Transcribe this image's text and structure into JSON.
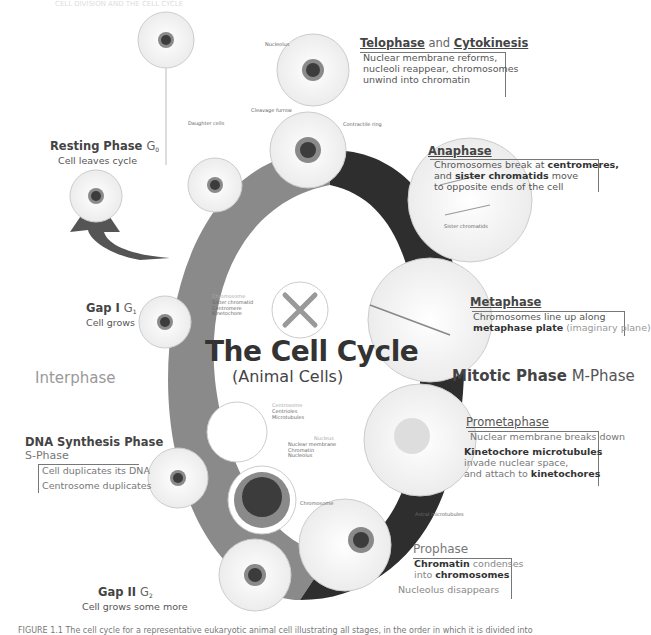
{
  "header": {
    "text": "CELL DIVISION AND THE CELL CYCLE"
  },
  "diagram": {
    "title": "The Cell Cycle",
    "subtitle": "(Animal Cells)",
    "interphase_label": "Interphase",
    "mitotic_label_bold": "Mitotic Phase",
    "mitotic_label_light": "M-Phase",
    "colors": {
      "interphase_arc": "#8a8a8a",
      "mitotic_arc": "#2e2e2e",
      "g0_arrow": "#555555",
      "cell_fill": "#f4f4f4",
      "nucleus_outer": "#9a9a9a",
      "nucleus_inner": "#3c3c3c"
    },
    "phases": {
      "resting": {
        "title": "Resting Phase",
        "sub": "G",
        "subscript": "0",
        "desc": "Cell leaves cycle"
      },
      "gap1": {
        "title": "Gap I",
        "sub": "G",
        "subscript": "1",
        "desc": "Cell grows"
      },
      "dna": {
        "title": "DNA Synthesis Phase",
        "sub": "S-Phase",
        "items": [
          "Cell duplicates its DNA",
          "Centrosome duplicates"
        ]
      },
      "gap2": {
        "title": "Gap II",
        "sub": "G",
        "subscript": "2",
        "desc": "Cell grows some more"
      },
      "prophase": {
        "title": "Prophase",
        "line1_bold": "Chromatin",
        "line1_rest": " condenses",
        "line2_pre": "into ",
        "line2_bold": "chromosomes",
        "extra": "Nucleolus disappears"
      },
      "prometaphase": {
        "title": "Prometaphase",
        "line1": "Nuclear membrane breaks down",
        "line2_bold": "Kinetochore microtubules",
        "line3": "invade nuclear space,",
        "line4_pre": "and attach to ",
        "line4_bold": "kinetochores"
      },
      "metaphase": {
        "title": "Metaphase",
        "line1": "Chromosomes line up along",
        "line2_bold": "metaphase plate",
        "line2_faint": " (imaginary plane)"
      },
      "anaphase": {
        "title": "Anaphase",
        "line1_pre": "Chromosomes break at ",
        "line1_bold": "centromeres,",
        "line2_pre": "and ",
        "line2_bold": "sister chromatids",
        "line2_rest": " move",
        "line3": "to opposite ends of the cell"
      },
      "telophase": {
        "title_a": "Telophase",
        "title_and": " and ",
        "title_b": "Cytokinesis",
        "line1": "Nuclear membrane reforms,",
        "line2": "nucleoli reappear, chromosomes",
        "line3": "unwind into chromatin"
      }
    },
    "small_labels": {
      "nucleolus_top": "Nucleolus",
      "daughter_cells": "Daughter cells",
      "cleavage_furrow": "Cleavage furrow",
      "contractile_ring": "Contractile ring",
      "sister_chromatids": "Sister chromatids",
      "astral_microtubules": "Astral microtubules",
      "chromosome_prophase": "Chromosome",
      "chromosome_inset": {
        "title": "Chromosome",
        "items": [
          "Sister chromatid",
          "Centromere",
          "Kinetochore"
        ]
      },
      "centrosome_inset": {
        "title": "Centrosome",
        "items": [
          "Centrioles",
          "Microtubules"
        ]
      },
      "nucleus_inset": {
        "title": "Nucleus",
        "items": [
          "Nuclear membrane",
          "Chromatin",
          "Nucleolus"
        ]
      }
    }
  },
  "caption": "FIGURE 1.1 The cell cycle for a representative eukaryotic animal cell illustrating all stages, in the order in which it is divided into"
}
